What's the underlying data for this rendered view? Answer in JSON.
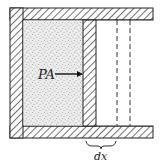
{
  "diagram": {
    "labels": {
      "force": "PA",
      "displacement": "dx"
    },
    "colors": {
      "line": "#222222",
      "hatch": "#333333",
      "gas_fill": "#e6e6e6",
      "gas_dots": "#555555",
      "background": "#ffffff"
    },
    "components": [
      {
        "name": "cylinder-wall",
        "description": "hatched cylinder walls (left, top, bottom)"
      },
      {
        "name": "gas-region",
        "description": "stippled gas inside cylinder"
      },
      {
        "name": "piston",
        "description": "hatched piston on right of gas"
      },
      {
        "name": "displaced-piston-outline",
        "description": "dashed outline of piston after moving dx"
      },
      {
        "name": "force-arrow",
        "description": "arrow labeled PA pushing on piston"
      },
      {
        "name": "dx-brace",
        "description": "brace under displacement labeled dx"
      }
    ]
  }
}
